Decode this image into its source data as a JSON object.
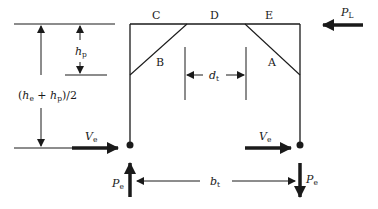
{
  "diagram": {
    "type": "structural-frame-free-body",
    "colors": {
      "stroke": "#1a1a1a",
      "background": "#ffffff"
    },
    "frame_labels": {
      "C": "C",
      "D": "D",
      "E": "E",
      "brace_left": "B",
      "brace_right": "A"
    },
    "loads": {
      "lateral_load": {
        "symbol": "P",
        "subscript": "L"
      },
      "shear_left": {
        "symbol": "V",
        "subscript": "e"
      },
      "shear_right": {
        "symbol": "V",
        "subscript": "e"
      },
      "axial_left": {
        "symbol": "P",
        "subscript": "e"
      },
      "axial_right": {
        "symbol": "P",
        "subscript": "e"
      }
    },
    "dimensions": {
      "brace_spacing": {
        "symbol": "d",
        "subscript": "t"
      },
      "panel_height": {
        "symbol": "h",
        "subscript": "p"
      },
      "base_width": {
        "symbol": "b",
        "subscript": "t"
      },
      "lever_arm": {
        "open": "(",
        "h1": "h",
        "h1_sub": "e",
        "plus": " + ",
        "h2": "h",
        "h2_sub": "p",
        "close": ")/2"
      }
    }
  }
}
